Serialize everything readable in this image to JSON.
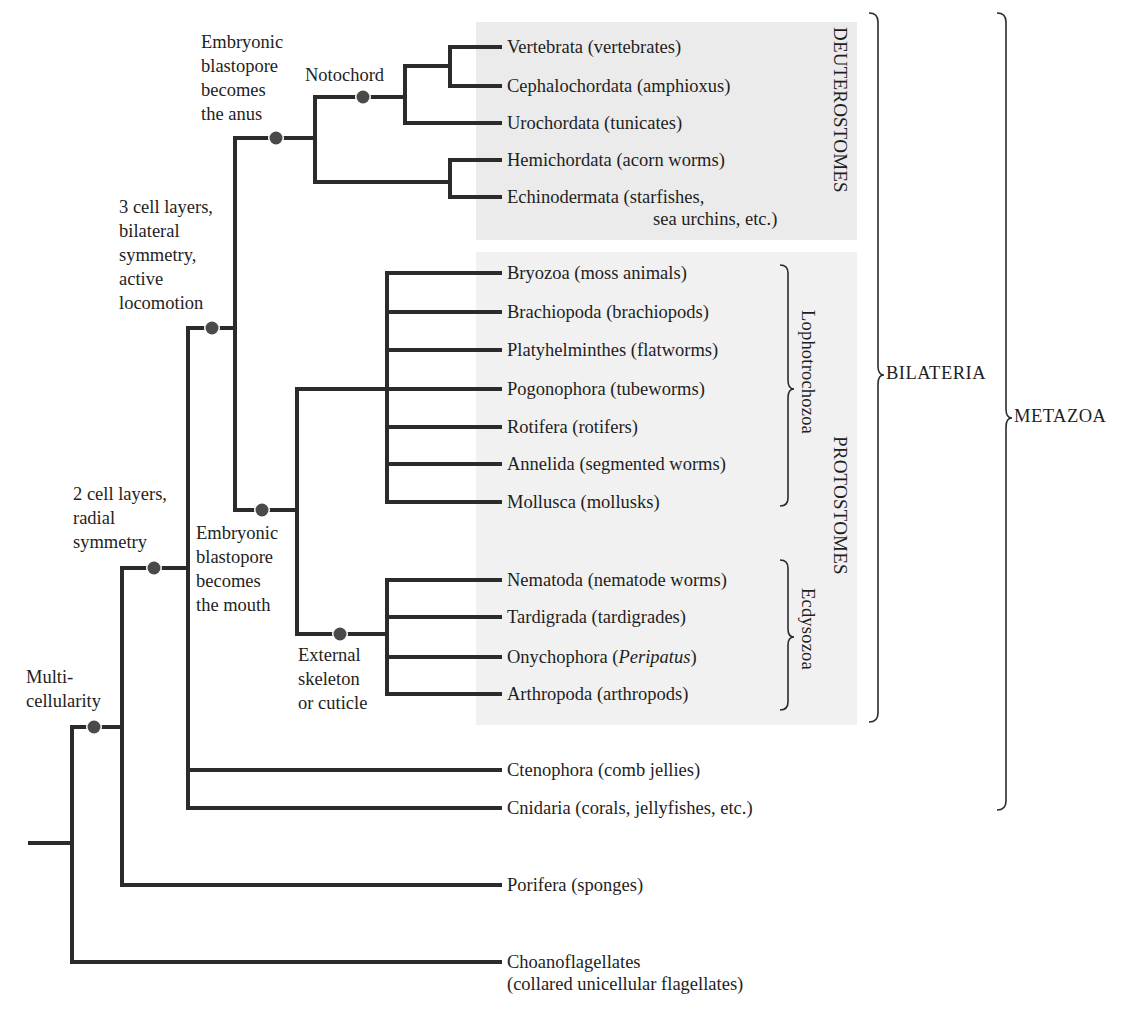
{
  "figure": {
    "colors": {
      "branch": "#2b2b2b",
      "node_dot": "#4a4a4a",
      "deuterostome_panel": "#ebebeb",
      "protostome_panel": "#f1f1f1",
      "text": "#1e1e1e"
    }
  },
  "characters": {
    "multicellularity": [
      "Multi-",
      "cellularity"
    ],
    "two_cell_layers": [
      "2 cell layers,",
      "radial",
      "symmetry"
    ],
    "three_cell_layers": [
      "3 cell layers,",
      "bilateral",
      "symmetry,",
      "active",
      "locomotion"
    ],
    "blastopore_anus": [
      "Embryonic",
      "blastopore",
      "becomes",
      "the anus"
    ],
    "notochord": [
      "Notochord"
    ],
    "blastopore_mouth": [
      "Embryonic",
      "blastopore",
      "becomes",
      "the mouth"
    ],
    "external_skeleton": [
      "External",
      "skeleton",
      "or cuticle"
    ]
  },
  "taxa": {
    "vertebrata": "Vertebrata (vertebrates)",
    "cephalochordata": "Cephalochordata (amphioxus)",
    "urochordata": "Urochordata (tunicates)",
    "hemichordata": "Hemichordata (acorn worms)",
    "echinodermata_1": "Echinodermata (starfishes,",
    "echinodermata_2": "sea urchins, etc.)",
    "bryozoa": "Bryozoa (moss animals)",
    "brachiopoda": "Brachiopoda (brachiopods)",
    "platyhelminthes": "Platyhelminthes (flatworms)",
    "pogonophora": "Pogonophora (tubeworms)",
    "rotifera": "Rotifera (rotifers)",
    "annelida": "Annelida (segmented worms)",
    "mollusca": "Mollusca (mollusks)",
    "nematoda": "Nematoda (nematode worms)",
    "tardigrada": "Tardigrada (tardigrades)",
    "onychophora_prefix": "Onychophora (",
    "onychophora_italic": "Peripatus",
    "onychophora_suffix": ")",
    "arthropoda": "Arthropoda (arthropods)",
    "ctenophora": "Ctenophora (comb jellies)",
    "cnidaria": "Cnidaria (corals, jellyfishes, etc.)",
    "porifera": "Porifera (sponges)",
    "choanoflagellates_1": "Choanoflagellates",
    "choanoflagellates_2": "(collared unicellular flagellates)"
  },
  "groups": {
    "deuterostomes": "DEUTEROSTOMES",
    "protostomes": "PROTOSTOMES",
    "lophotrochozoa": "Lophotrochozoa",
    "ecdysozoa": "Ecdysozoa",
    "bilateria": "BILATERIA",
    "metazoa": "METAZOA"
  }
}
